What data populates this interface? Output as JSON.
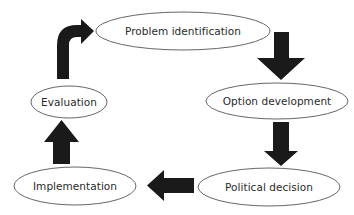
{
  "diagram": {
    "type": "cycle",
    "colors": {
      "background": "#ffffff",
      "node_stroke": "#555555",
      "node_fill": "#ffffff",
      "arrow_fill": "#1a1a1a",
      "text": "#2a2a2a"
    },
    "nodes": [
      {
        "id": "problem-identification",
        "label": "Problem identification",
        "cx": 183,
        "cy": 31,
        "rx": 87,
        "ry": 19
      },
      {
        "id": "option-development",
        "label": "Option development",
        "cx": 277,
        "cy": 101,
        "rx": 71,
        "ry": 18
      },
      {
        "id": "political-decision",
        "label": "Political decision",
        "cx": 269,
        "cy": 187,
        "rx": 71,
        "ry": 19
      },
      {
        "id": "implementation",
        "label": "Implementation",
        "cx": 75,
        "cy": 186,
        "rx": 61,
        "ry": 19
      },
      {
        "id": "evaluation",
        "label": "Evaluation",
        "cx": 69,
        "cy": 102,
        "rx": 38,
        "ry": 16
      }
    ],
    "edges": [
      {
        "from": "problem-identification",
        "to": "option-development",
        "direction": "down"
      },
      {
        "from": "option-development",
        "to": "political-decision",
        "direction": "down"
      },
      {
        "from": "political-decision",
        "to": "implementation",
        "direction": "left"
      },
      {
        "from": "implementation",
        "to": "evaluation",
        "direction": "up"
      },
      {
        "from": "evaluation",
        "to": "problem-identification",
        "direction": "up-then-right"
      }
    ]
  }
}
